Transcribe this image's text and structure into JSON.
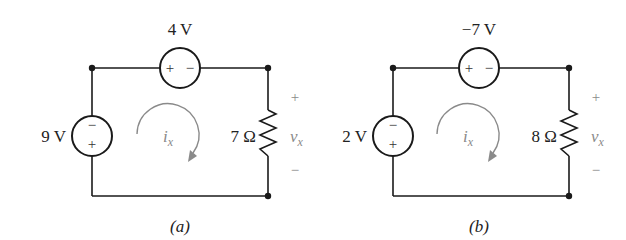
{
  "figure": {
    "panels": [
      {
        "caption": "(a)",
        "top_source": {
          "value": "4 V",
          "plus": "+",
          "minus": "−"
        },
        "left_source": {
          "value": "9 V",
          "top_sign": "−",
          "bottom_sign": "+"
        },
        "resistor": {
          "value": "7 Ω"
        },
        "loop_current": {
          "symbol": "i",
          "subscript": "x",
          "direction": "clockwise"
        },
        "voltage": {
          "symbol": "v",
          "subscript": "x",
          "plus": "+",
          "minus": "−"
        }
      },
      {
        "caption": "(b)",
        "top_source": {
          "value": "−7 V",
          "plus": "+",
          "minus": "−"
        },
        "left_source": {
          "value": "2 V",
          "top_sign": "−",
          "bottom_sign": "+"
        },
        "resistor": {
          "value": "8 Ω"
        },
        "loop_current": {
          "symbol": "i",
          "subscript": "x",
          "direction": "clockwise"
        },
        "voltage": {
          "symbol": "v",
          "subscript": "x",
          "plus": "+",
          "minus": "−"
        }
      }
    ]
  },
  "colors": {
    "wire": "#1a1a1a",
    "annotation": "#8a8a8a",
    "background": "#ffffff"
  }
}
